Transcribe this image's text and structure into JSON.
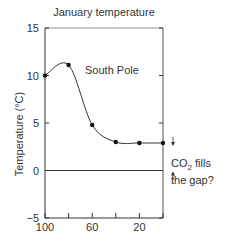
{
  "chart_data": {
    "type": "line",
    "title": "January temperature",
    "xlabel": "",
    "ylabel": "Temperature (°C)",
    "x": [
      100,
      80,
      60,
      40,
      20,
      0
    ],
    "series": [
      {
        "name": "South Pole",
        "values": [
          10,
          11.1,
          4.8,
          3.0,
          2.9,
          2.9
        ]
      }
    ],
    "xlim": [
      100,
      0
    ],
    "ylim": [
      -5,
      15
    ],
    "x_ticks": [
      100,
      80,
      60,
      40,
      20,
      0
    ],
    "x_tick_labels": [
      "100",
      "",
      "60",
      "",
      "20",
      ""
    ],
    "y_ticks": [
      -5,
      0,
      5,
      10,
      15
    ],
    "y_tick_labels": [
      "−5",
      "0",
      "5",
      "10",
      "15"
    ],
    "grid": false,
    "reference_lines": [
      {
        "axis": "y",
        "value": 0
      }
    ],
    "annotations": [
      {
        "text": "South Pole",
        "x": 55,
        "y": 10
      },
      {
        "text": "CO₂ fills the gap?",
        "x": -5,
        "y": 1.5,
        "arrows": "between 0 and 2.9"
      }
    ]
  },
  "labels": {
    "title": "January temperature",
    "ylabel": "Temperature (°C)",
    "series_label": "South Pole",
    "annot_line1_prefix": "CO",
    "annot_line1_sub": "2",
    "annot_line1_suffix": " fills",
    "annot_line2": "the gap?"
  }
}
